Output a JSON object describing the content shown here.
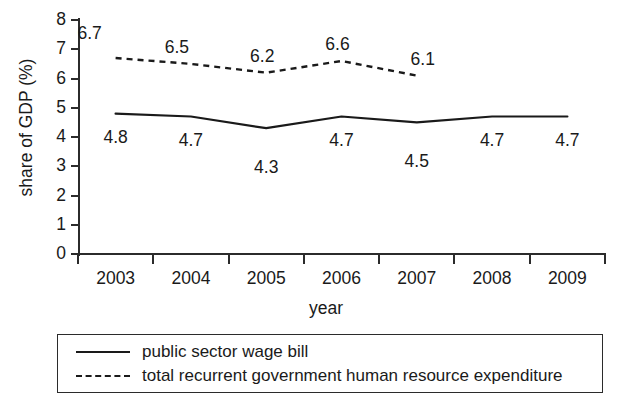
{
  "chart_data": {
    "type": "line",
    "title": "",
    "xlabel": "year",
    "ylabel": "share of GDP (%)",
    "categories": [
      "2003",
      "2004",
      "2005",
      "2006",
      "2007",
      "2008",
      "2009"
    ],
    "ylim": [
      0,
      8
    ],
    "yticks": [
      "0",
      "1",
      "2",
      "3",
      "4",
      "5",
      "6",
      "7",
      "8"
    ],
    "grid": false,
    "legend_position": "bottom",
    "series": [
      {
        "name": "public sector wage bill",
        "style": "solid",
        "color": "#1a1a1a",
        "values": [
          4.8,
          4.7,
          4.3,
          4.7,
          4.5,
          4.7,
          4.7
        ],
        "labels": [
          "4.8",
          "4.7",
          "4.3",
          "4.7",
          "4.5",
          "4.7",
          "4.7"
        ]
      },
      {
        "name": "total recurrent government human resource expenditure",
        "style": "dashed",
        "color": "#1a1a1a",
        "values": [
          6.7,
          6.5,
          6.2,
          6.6,
          6.1,
          null,
          null
        ],
        "labels": [
          "6.7",
          "6.5",
          "6.2",
          "6.6",
          "6.1",
          "",
          ""
        ]
      }
    ]
  },
  "legend": {
    "items": [
      {
        "label": "public sector wage bill",
        "style": "solid"
      },
      {
        "label": "total recurrent government human resource expenditure",
        "style": "dashed"
      }
    ]
  }
}
